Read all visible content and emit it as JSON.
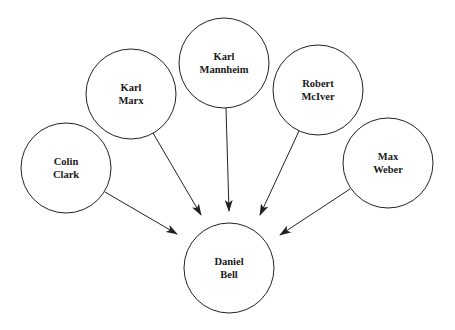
{
  "diagram": {
    "type": "influence-diagram",
    "colors": {
      "background": "#ffffff",
      "stroke": "#222222",
      "text": "#1a1a1a"
    },
    "nodes": [
      {
        "id": "mannheim",
        "line1": "Karl",
        "line2": "Mannheim",
        "cx": 224,
        "cy": 63,
        "r": 45
      },
      {
        "id": "marx",
        "line1": "Karl",
        "line2": "Marx",
        "cx": 131,
        "cy": 94,
        "r": 45
      },
      {
        "id": "mciver",
        "line1": "Robert",
        "line2": "McIver",
        "cx": 318,
        "cy": 90,
        "r": 45
      },
      {
        "id": "clark",
        "line1": "Colin",
        "line2": "Clark",
        "cx": 66,
        "cy": 168,
        "r": 45
      },
      {
        "id": "weber",
        "line1": "Max",
        "line2": "Weber",
        "cx": 388,
        "cy": 163,
        "r": 45
      },
      {
        "id": "bell",
        "line1": "Daniel",
        "line2": "Bell",
        "cx": 229,
        "cy": 268,
        "r": 45
      }
    ],
    "edges": [
      {
        "from": "mannheim",
        "to": "bell",
        "x1": 226,
        "y1": 108,
        "x2": 229,
        "y2": 211
      },
      {
        "from": "marx",
        "to": "bell",
        "x1": 153,
        "y1": 133,
        "x2": 201,
        "y2": 215
      },
      {
        "from": "mciver",
        "to": "bell",
        "x1": 299,
        "y1": 131,
        "x2": 260,
        "y2": 215
      },
      {
        "from": "clark",
        "to": "bell",
        "x1": 105,
        "y1": 192,
        "x2": 177,
        "y2": 234
      },
      {
        "from": "weber",
        "to": "bell",
        "x1": 350,
        "y1": 189,
        "x2": 280,
        "y2": 235
      }
    ]
  }
}
